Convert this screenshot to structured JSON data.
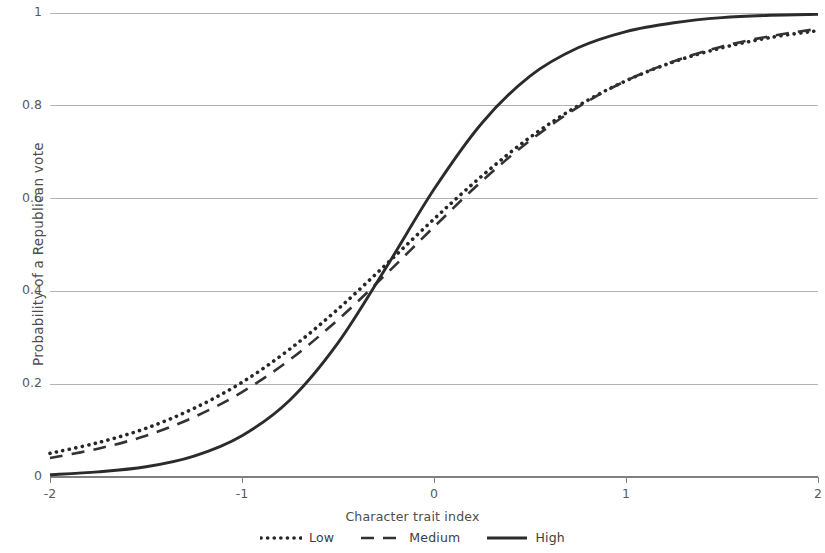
{
  "chart_data": {
    "type": "line",
    "title": "",
    "xlabel": "Character trait index",
    "ylabel": "Probability of a Republican vote",
    "xlim": [
      -2,
      2
    ],
    "ylim": [
      0,
      1
    ],
    "xticks": [
      -2,
      -1,
      0,
      1,
      2
    ],
    "xtick_labels": [
      "-2",
      "-1",
      "0",
      "1",
      "2"
    ],
    "yticks": [
      0,
      0.2,
      0.4,
      0.6,
      0.8,
      1
    ],
    "ytick_labels": [
      "0",
      "0.2",
      "0.4",
      "0.6",
      "0.8",
      "1"
    ],
    "grid": "horizontal",
    "legend_position": "bottom",
    "x": [
      -2,
      -1.75,
      -1.5,
      -1.25,
      -1,
      -0.75,
      -0.5,
      -0.25,
      0,
      0.25,
      0.5,
      0.75,
      1,
      1.25,
      1.5,
      1.75,
      2
    ],
    "series": [
      {
        "name": "Low",
        "style": "dotted",
        "color": "#262626",
        "values": [
          0.051,
          0.074,
          0.105,
          0.148,
          0.204,
          0.276,
          0.362,
          0.458,
          0.556,
          0.649,
          0.732,
          0.8,
          0.854,
          0.895,
          0.925,
          0.947,
          0.962
        ]
      },
      {
        "name": "Medium",
        "style": "dashed",
        "color": "#333333",
        "values": [
          0.041,
          0.061,
          0.089,
          0.129,
          0.183,
          0.253,
          0.339,
          0.437,
          0.539,
          0.638,
          0.725,
          0.797,
          0.854,
          0.896,
          0.928,
          0.95,
          0.966
        ]
      },
      {
        "name": "High",
        "style": "solid",
        "color": "#2b2b2b",
        "values": [
          0.005,
          0.011,
          0.022,
          0.045,
          0.089,
          0.166,
          0.289,
          0.451,
          0.62,
          0.763,
          0.864,
          0.925,
          0.96,
          0.979,
          0.99,
          0.995,
          0.997
        ]
      }
    ]
  },
  "legend": {
    "items": [
      {
        "label": "Low"
      },
      {
        "label": "Medium"
      },
      {
        "label": "High"
      }
    ]
  },
  "axes": {
    "x_title": "Character trait index",
    "y_title": "Probability of a Republican vote"
  },
  "colors": {
    "gridline": "#b3b3b3",
    "axis": "#808080",
    "text": "#4d4d4d",
    "curve": "#262626"
  }
}
